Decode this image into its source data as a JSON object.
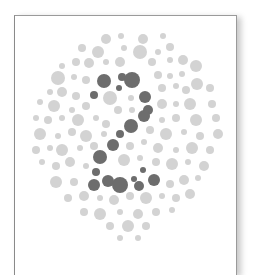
{
  "plate": {
    "label": "Color vision test plate",
    "hidden_numeral": "2",
    "colors": {
      "background_dots": "#d3d3d3",
      "figure_dots": "#6d6d6d",
      "card_border": "#8f8f8f",
      "card_background": "#ffffff"
    },
    "figure_dots": [
      [
        104,
        81,
        7
      ],
      [
        122,
        77,
        4
      ],
      [
        119,
        88,
        3
      ],
      [
        132,
        80,
        8
      ],
      [
        94,
        95,
        4
      ],
      [
        145,
        97,
        6
      ],
      [
        148,
        110,
        5
      ],
      [
        144,
        116,
        6
      ],
      [
        131,
        126,
        7
      ],
      [
        120,
        134,
        4
      ],
      [
        113,
        145,
        6
      ],
      [
        100,
        157,
        7
      ],
      [
        96,
        172,
        4
      ],
      [
        94,
        185,
        6
      ],
      [
        108,
        181,
        6
      ],
      [
        120,
        185,
        8
      ],
      [
        134,
        179,
        3
      ],
      [
        139,
        186,
        5
      ],
      [
        154,
        180,
        6
      ],
      [
        143,
        170,
        3
      ]
    ],
    "background_dots": [
      [
        106,
        39,
        5
      ],
      [
        121,
        36,
        3
      ],
      [
        143,
        39,
        5
      ],
      [
        163,
        36,
        3
      ],
      [
        82,
        48,
        4
      ],
      [
        98,
        52,
        6
      ],
      [
        124,
        48,
        3
      ],
      [
        140,
        52,
        7
      ],
      [
        158,
        52,
        3
      ],
      [
        170,
        47,
        4
      ],
      [
        62,
        66,
        3
      ],
      [
        76,
        62,
        4
      ],
      [
        89,
        63,
        5
      ],
      [
        106,
        62,
        3
      ],
      [
        120,
        62,
        5
      ],
      [
        152,
        62,
        4
      ],
      [
        170,
        60,
        3
      ],
      [
        183,
        60,
        5
      ],
      [
        58,
        78,
        7
      ],
      [
        74,
        77,
        3
      ],
      [
        86,
        80,
        4
      ],
      [
        158,
        75,
        4
      ],
      [
        170,
        76,
        3
      ],
      [
        182,
        74,
        3
      ],
      [
        196,
        66,
        6
      ],
      [
        197,
        84,
        6
      ],
      [
        50,
        92,
        3
      ],
      [
        62,
        92,
        5
      ],
      [
        76,
        96,
        4
      ],
      [
        110,
        98,
        7
      ],
      [
        131,
        98,
        3
      ],
      [
        162,
        88,
        4
      ],
      [
        176,
        86,
        3
      ],
      [
        186,
        90,
        4
      ],
      [
        210,
        88,
        4
      ],
      [
        40,
        102,
        3
      ],
      [
        54,
        106,
        6
      ],
      [
        72,
        110,
        3
      ],
      [
        86,
        106,
        4
      ],
      [
        118,
        110,
        4
      ],
      [
        132,
        110,
        3
      ],
      [
        162,
        104,
        5
      ],
      [
        176,
        104,
        3
      ],
      [
        190,
        104,
        6
      ],
      [
        212,
        104,
        4
      ],
      [
        36,
        118,
        3
      ],
      [
        48,
        120,
        4
      ],
      [
        62,
        118,
        3
      ],
      [
        78,
        120,
        6
      ],
      [
        96,
        118,
        3
      ],
      [
        106,
        124,
        4
      ],
      [
        162,
        120,
        3
      ],
      [
        176,
        118,
        4
      ],
      [
        196,
        120,
        6
      ],
      [
        216,
        118,
        4
      ],
      [
        40,
        134,
        6
      ],
      [
        58,
        136,
        3
      ],
      [
        72,
        132,
        4
      ],
      [
        86,
        136,
        6
      ],
      [
        104,
        134,
        3
      ],
      [
        150,
        130,
        4
      ],
      [
        166,
        134,
        6
      ],
      [
        184,
        132,
        3
      ],
      [
        200,
        136,
        4
      ],
      [
        218,
        134,
        5
      ],
      [
        36,
        150,
        4
      ],
      [
        50,
        148,
        3
      ],
      [
        62,
        150,
        6
      ],
      [
        80,
        148,
        3
      ],
      [
        94,
        146,
        4
      ],
      [
        130,
        146,
        4
      ],
      [
        144,
        142,
        3
      ],
      [
        158,
        148,
        5
      ],
      [
        176,
        150,
        3
      ],
      [
        192,
        148,
        6
      ],
      [
        210,
        150,
        4
      ],
      [
        42,
        162,
        3
      ],
      [
        56,
        166,
        4
      ],
      [
        70,
        162,
        5
      ],
      [
        86,
        166,
        3
      ],
      [
        124,
        160,
        6
      ],
      [
        140,
        158,
        3
      ],
      [
        156,
        162,
        4
      ],
      [
        172,
        164,
        6
      ],
      [
        188,
        162,
        3
      ],
      [
        204,
        166,
        5
      ],
      [
        56,
        182,
        6
      ],
      [
        74,
        182,
        4
      ],
      [
        170,
        184,
        4
      ],
      [
        184,
        180,
        5
      ],
      [
        198,
        178,
        3
      ],
      [
        68,
        198,
        4
      ],
      [
        84,
        196,
        5
      ],
      [
        100,
        198,
        3
      ],
      [
        114,
        200,
        5
      ],
      [
        130,
        196,
        4
      ],
      [
        146,
        198,
        6
      ],
      [
        162,
        196,
        3
      ],
      [
        176,
        198,
        4
      ],
      [
        190,
        194,
        5
      ],
      [
        84,
        212,
        4
      ],
      [
        100,
        214,
        6
      ],
      [
        120,
        212,
        3
      ],
      [
        138,
        214,
        5
      ],
      [
        156,
        212,
        4
      ],
      [
        172,
        210,
        3
      ],
      [
        110,
        226,
        4
      ],
      [
        128,
        226,
        6
      ],
      [
        146,
        226,
        4
      ],
      [
        120,
        238,
        3
      ],
      [
        138,
        238,
        3
      ]
    ]
  }
}
